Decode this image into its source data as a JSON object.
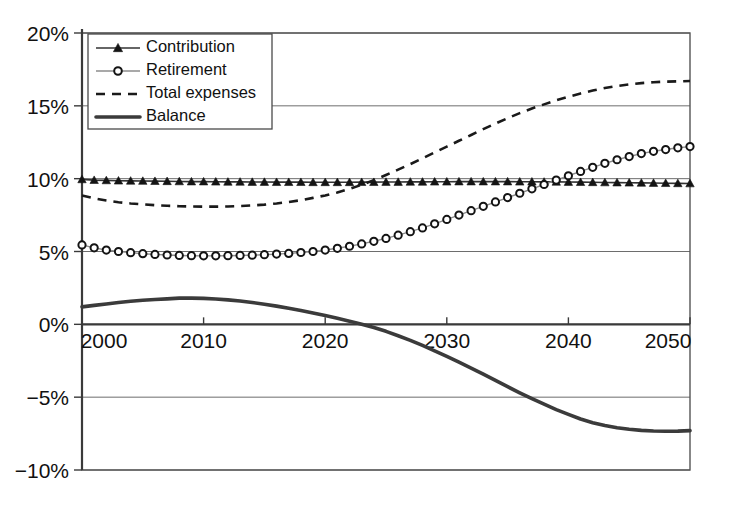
{
  "chart_data": {
    "type": "line",
    "title": "",
    "xlabel": "",
    "ylabel": "",
    "xlim": [
      2000,
      2050
    ],
    "ylim": [
      -10,
      20
    ],
    "grid": true,
    "legend_position": "top-left",
    "x_ticks": [
      "2000",
      "2010",
      "2020",
      "2030",
      "2040",
      "2050"
    ],
    "x_tick_values": [
      2000,
      2010,
      2020,
      2030,
      2040,
      2050
    ],
    "y_ticks": [
      "-10%",
      "-5%",
      "0%",
      "5%",
      "10%",
      "15%",
      "20%"
    ],
    "y_tick_values": [
      -10,
      -5,
      0,
      5,
      10,
      15,
      20
    ],
    "x": [
      2000,
      2001,
      2002,
      2003,
      2004,
      2005,
      2006,
      2007,
      2008,
      2009,
      2010,
      2011,
      2012,
      2013,
      2014,
      2015,
      2016,
      2017,
      2018,
      2019,
      2020,
      2021,
      2022,
      2023,
      2024,
      2025,
      2026,
      2027,
      2028,
      2029,
      2030,
      2031,
      2032,
      2033,
      2034,
      2035,
      2036,
      2037,
      2038,
      2039,
      2040,
      2041,
      2042,
      2043,
      2044,
      2045,
      2046,
      2047,
      2048,
      2049,
      2050
    ],
    "series": [
      {
        "name": "Contribution",
        "marker": "triangle",
        "line_style": "solid",
        "color": "#141414",
        "values": [
          9.95,
          9.9,
          9.88,
          9.86,
          9.85,
          9.84,
          9.83,
          9.82,
          9.81,
          9.8,
          9.8,
          9.79,
          9.78,
          9.78,
          9.77,
          9.77,
          9.76,
          9.76,
          9.76,
          9.75,
          9.75,
          9.75,
          9.75,
          9.76,
          9.76,
          9.77,
          9.77,
          9.78,
          9.78,
          9.79,
          9.79,
          9.8,
          9.8,
          9.8,
          9.8,
          9.8,
          9.79,
          9.79,
          9.78,
          9.78,
          9.77,
          9.76,
          9.75,
          9.74,
          9.73,
          9.72,
          9.71,
          9.7,
          9.69,
          9.68,
          9.67
        ]
      },
      {
        "name": "Retirement",
        "marker": "circle",
        "line_style": "solid",
        "color": "#8c8c8c",
        "values": [
          5.45,
          5.25,
          5.1,
          5.0,
          4.92,
          4.85,
          4.8,
          4.76,
          4.73,
          4.71,
          4.7,
          4.7,
          4.71,
          4.73,
          4.75,
          4.78,
          4.82,
          4.87,
          4.93,
          5.0,
          5.1,
          5.22,
          5.36,
          5.52,
          5.7,
          5.9,
          6.12,
          6.36,
          6.62,
          6.9,
          7.2,
          7.5,
          7.8,
          8.1,
          8.4,
          8.7,
          9.0,
          9.3,
          9.6,
          9.9,
          10.2,
          10.5,
          10.78,
          11.05,
          11.3,
          11.52,
          11.72,
          11.88,
          12.0,
          12.12,
          12.2
        ]
      },
      {
        "name": "Total expenses",
        "marker": "none",
        "line_style": "dashed",
        "color": "#1a1a1a",
        "values": [
          8.85,
          8.65,
          8.5,
          8.38,
          8.3,
          8.24,
          8.18,
          8.14,
          8.11,
          8.09,
          8.08,
          8.08,
          8.09,
          8.12,
          8.16,
          8.22,
          8.3,
          8.4,
          8.52,
          8.68,
          8.85,
          9.05,
          9.3,
          9.58,
          9.9,
          10.25,
          10.62,
          11.0,
          11.4,
          11.8,
          12.2,
          12.6,
          13.0,
          13.4,
          13.78,
          14.15,
          14.5,
          14.82,
          15.1,
          15.38,
          15.62,
          15.85,
          16.05,
          16.22,
          16.36,
          16.47,
          16.56,
          16.62,
          16.66,
          16.68,
          16.7
        ]
      },
      {
        "name": "Balance",
        "marker": "none",
        "line_style": "thick-solid",
        "color": "#3b3b3b",
        "values": [
          1.2,
          1.3,
          1.4,
          1.5,
          1.58,
          1.65,
          1.7,
          1.75,
          1.8,
          1.8,
          1.78,
          1.74,
          1.68,
          1.6,
          1.5,
          1.38,
          1.25,
          1.1,
          0.95,
          0.78,
          0.6,
          0.42,
          0.22,
          0.0,
          -0.22,
          -0.48,
          -0.78,
          -1.1,
          -1.45,
          -1.82,
          -2.2,
          -2.6,
          -3.0,
          -3.42,
          -3.85,
          -4.28,
          -4.7,
          -5.1,
          -5.48,
          -5.85,
          -6.18,
          -6.5,
          -6.75,
          -6.95,
          -7.1,
          -7.2,
          -7.28,
          -7.32,
          -7.34,
          -7.33,
          -7.3
        ]
      }
    ],
    "legend_entries": [
      {
        "label": "Contribution",
        "marker": "triangle",
        "line_style": "solid"
      },
      {
        "label": "Retirement",
        "marker": "circle",
        "line_style": "solid"
      },
      {
        "label": "Total expenses",
        "marker": "none",
        "line_style": "dashed"
      },
      {
        "label": "Balance",
        "marker": "none",
        "line_style": "thick-solid"
      }
    ]
  }
}
